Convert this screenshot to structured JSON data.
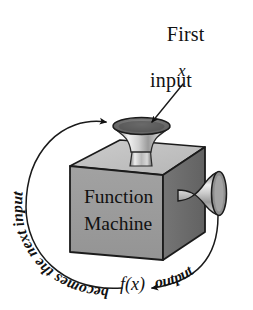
{
  "diagram": {
    "type": "function-machine",
    "title_lines": [
      "First",
      "input"
    ],
    "input_variable": "x",
    "machine_label_line1": "Function",
    "machine_label_line2": "Machine",
    "output_value": "f(x)",
    "output_arrow_label": "output",
    "feedback_arrow_label": "becomes the next input",
    "colors": {
      "ink": "#111111",
      "box_front": "#9a9a9a",
      "box_top": "#c3c3c3",
      "box_right": "#6d6d6d",
      "funnel_light": "#e9e9e9",
      "funnel_mid": "#b4b4b4",
      "funnel_dark": "#6e6e6e",
      "rim_dark": "#5a5a5a",
      "background": "#ffffff"
    }
  }
}
